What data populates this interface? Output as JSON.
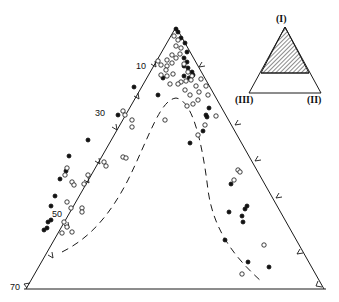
{
  "figure": {
    "type": "ternary-diagram",
    "stroke_color": "#1a1a1a",
    "background": "#ffffff"
  },
  "main_triangle": {
    "vertices": {
      "apex": [
        176,
        27
      ],
      "left": [
        26,
        289
      ],
      "right": [
        324,
        289
      ]
    },
    "left_axis_ticks": [
      {
        "label": "10",
        "pos": [
          66,
          67
        ],
        "value": 10
      },
      {
        "label": "30",
        "pos": [
          34,
          111
        ],
        "value": 30
      },
      {
        "label": "50",
        "pos": [
          39,
          225
        ],
        "value": 50
      },
      {
        "label": "70",
        "pos": [
          11,
          289
        ],
        "value": 70
      }
    ]
  },
  "inset": {
    "vertex_labels": {
      "top": "(I)",
      "bottom_left": "(III)",
      "bottom_right": "(II)"
    },
    "hatched_region": "upper portion (I)-dominant"
  },
  "boundary_curve": {
    "style": "dashed",
    "description": "bell-shaped dashed envelope peaking near apex-center"
  },
  "chart_data": {
    "type": "scatter",
    "title": "",
    "subtitle": "Ternary plot of compositions (I)-(II)-(III)",
    "legend": [],
    "axes": {
      "left_edge_ticks": [
        "10",
        "30",
        "50",
        "70"
      ],
      "vertex_labels": [
        "(I)",
        "(II)",
        "(III)"
      ]
    },
    "series": [
      {
        "name": "filled circles",
        "marker": "filled",
        "points_px": [
          [
            176,
            29
          ],
          [
            178,
            32
          ],
          [
            181,
            38
          ],
          [
            185,
            43
          ],
          [
            187,
            52
          ],
          [
            184,
            58
          ],
          [
            187,
            62
          ],
          [
            184,
            66
          ],
          [
            188,
            68
          ],
          [
            192,
            72
          ],
          [
            193,
            75
          ],
          [
            184,
            76
          ],
          [
            189,
            78
          ],
          [
            163,
            78
          ],
          [
            158,
            95
          ],
          [
            209,
            108
          ],
          [
            206,
            115
          ],
          [
            207,
            117
          ],
          [
            203,
            131
          ],
          [
            190,
            143
          ],
          [
            225,
            240
          ],
          [
            231,
            184
          ],
          [
            229,
            212
          ],
          [
            134,
            87
          ],
          [
            118,
            115
          ],
          [
            88,
            140
          ],
          [
            69,
            156
          ],
          [
            66,
            171
          ],
          [
            60,
            179
          ],
          [
            55,
            196
          ],
          [
            51,
            206
          ],
          [
            51,
            220
          ],
          [
            48,
            222
          ],
          [
            47,
            228
          ],
          [
            44,
            230
          ],
          [
            247,
            206
          ],
          [
            245,
            209
          ],
          [
            242,
            216
          ],
          [
            243,
            222
          ],
          [
            248,
            262
          ],
          [
            269,
            267
          ]
        ]
      },
      {
        "name": "open circles",
        "marker": "open",
        "points_px": [
          [
            174,
            36
          ],
          [
            178,
            40
          ],
          [
            176,
            46
          ],
          [
            181,
            48
          ],
          [
            172,
            55
          ],
          [
            176,
            58
          ],
          [
            180,
            54
          ],
          [
            167,
            60
          ],
          [
            172,
            63
          ],
          [
            167,
            66
          ],
          [
            158,
            61
          ],
          [
            161,
            65
          ],
          [
            166,
            70
          ],
          [
            161,
            75
          ],
          [
            167,
            76
          ],
          [
            173,
            74
          ],
          [
            184,
            64
          ],
          [
            188,
            72
          ],
          [
            192,
            76
          ],
          [
            181,
            82
          ],
          [
            196,
            86
          ],
          [
            199,
            92
          ],
          [
            190,
            95
          ],
          [
            193,
            104
          ],
          [
            187,
            106
          ],
          [
            201,
            79
          ],
          [
            191,
            80
          ],
          [
            178,
            84
          ],
          [
            186,
            81
          ],
          [
            170,
            84
          ],
          [
            185,
            90
          ],
          [
            198,
            100
          ],
          [
            206,
            86
          ],
          [
            208,
            95
          ],
          [
            165,
            120
          ],
          [
            198,
            135
          ],
          [
            205,
            125
          ],
          [
            216,
            116
          ],
          [
            234,
            180
          ],
          [
            238,
            170
          ],
          [
            240,
            172
          ],
          [
            123,
            111
          ],
          [
            125,
            115
          ],
          [
            132,
            120
          ],
          [
            132,
            127
          ],
          [
            104,
            162
          ],
          [
            106,
            166
          ],
          [
            123,
            157
          ],
          [
            126,
            158
          ],
          [
            67,
            168
          ],
          [
            88,
            175
          ],
          [
            65,
            175
          ],
          [
            72,
            182
          ],
          [
            74,
            185
          ],
          [
            84,
            184
          ],
          [
            67,
            202
          ],
          [
            71,
            208
          ],
          [
            82,
            208
          ],
          [
            82,
            212
          ],
          [
            64,
            222
          ],
          [
            67,
            227
          ],
          [
            62,
            233
          ],
          [
            72,
            232
          ],
          [
            242,
            274
          ],
          [
            264,
            245
          ]
        ]
      }
    ]
  }
}
